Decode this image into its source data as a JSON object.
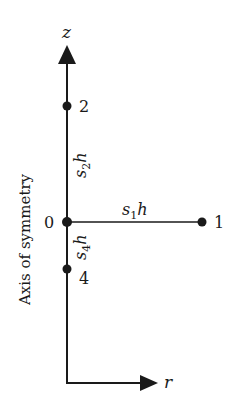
{
  "diagram": {
    "axes": {
      "z_label": "z",
      "r_label": "r",
      "symmetry_label": "Axis of symmetry"
    },
    "nodes": [
      {
        "id": "0",
        "label": "0"
      },
      {
        "id": "1",
        "label": "1"
      },
      {
        "id": "2",
        "label": "2"
      },
      {
        "id": "4",
        "label": "4"
      }
    ],
    "segments": {
      "s1h": {
        "base": "s",
        "sub": "1",
        "tail": "h"
      },
      "s2h": {
        "base": "s",
        "sub": "2",
        "tail": "h"
      },
      "s4h": {
        "base": "s",
        "sub": "4",
        "tail": "h"
      }
    },
    "colors": {
      "ink": "#1a1a1a",
      "background": "#ffffff"
    }
  }
}
